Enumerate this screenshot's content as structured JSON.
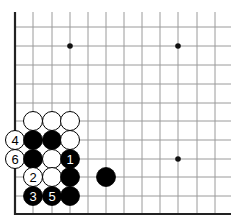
{
  "diagram": {
    "type": "go-board-fragment",
    "colors": {
      "background": "#ffffff",
      "grid_line": "#9a9a9a",
      "edge_line": "#222222",
      "black_stone": "#000000",
      "white_stone": "#ffffff",
      "stone_outline": "#000000",
      "star_point": "#111111"
    },
    "grid": {
      "x": [
        15,
        33,
        52,
        70,
        88,
        106,
        124,
        142,
        160,
        178,
        197,
        215
      ],
      "y": [
        27,
        46,
        65,
        84,
        103,
        121,
        140,
        159,
        177,
        196,
        214
      ],
      "x_extent": [
        15,
        231
      ],
      "y_extent": [
        12,
        214
      ],
      "left_edge": true,
      "bottom_edge": true
    },
    "star_points": [
      {
        "col": 3,
        "row": 1
      },
      {
        "col": 9,
        "row": 1
      },
      {
        "col": 9,
        "row": 7
      }
    ],
    "stones": [
      {
        "color": "white",
        "col": 1,
        "row": 5,
        "label": ""
      },
      {
        "color": "white",
        "col": 2,
        "row": 5,
        "label": ""
      },
      {
        "color": "white",
        "col": 3,
        "row": 5,
        "label": ""
      },
      {
        "color": "white",
        "col": 0,
        "row": 6,
        "label": "4"
      },
      {
        "color": "black",
        "col": 1,
        "row": 6,
        "label": ""
      },
      {
        "color": "black",
        "col": 2,
        "row": 6,
        "label": ""
      },
      {
        "color": "white",
        "col": 3,
        "row": 6,
        "label": ""
      },
      {
        "color": "white",
        "col": 0,
        "row": 7,
        "label": "6"
      },
      {
        "color": "black",
        "col": 1,
        "row": 7,
        "label": ""
      },
      {
        "color": "white",
        "col": 2,
        "row": 7,
        "label": ""
      },
      {
        "color": "black",
        "col": 3,
        "row": 7,
        "label": "1"
      },
      {
        "color": "white",
        "col": 1,
        "row": 8,
        "label": "2"
      },
      {
        "color": "white",
        "col": 2,
        "row": 8,
        "label": ""
      },
      {
        "color": "black",
        "col": 3,
        "row": 8,
        "label": ""
      },
      {
        "color": "black",
        "col": 5,
        "row": 8,
        "label": ""
      },
      {
        "color": "black",
        "col": 1,
        "row": 9,
        "label": "3"
      },
      {
        "color": "black",
        "col": 2,
        "row": 9,
        "label": "5"
      },
      {
        "color": "black",
        "col": 3,
        "row": 9,
        "label": ""
      }
    ],
    "stone_radius": 9.5
  }
}
